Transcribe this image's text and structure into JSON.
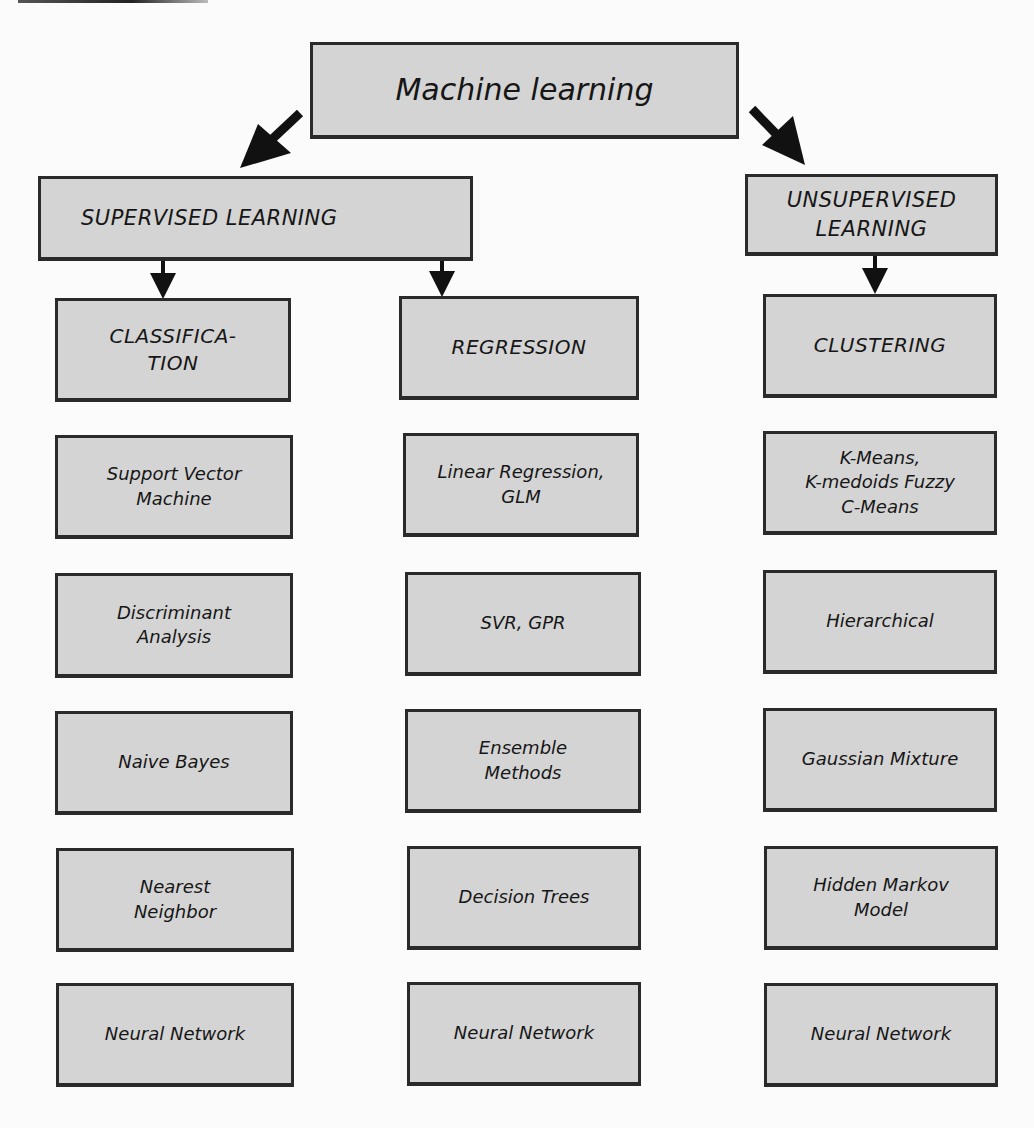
{
  "diagram": {
    "root": {
      "label": "Machine learning"
    },
    "branches": [
      {
        "label": "SUPERVISED LEARNING",
        "categories": [
          {
            "label": "CLASSIFICA-\nTION",
            "methods": [
              "Support Vector\nMachine",
              "Discriminant\nAnalysis",
              "Naive Bayes",
              "Nearest\nNeighbor",
              "Neural Network"
            ]
          },
          {
            "label": "REGRESSION",
            "methods": [
              "Linear Regression,\nGLM",
              "SVR, GPR",
              "Ensemble\nMethods",
              "Decision Trees",
              "Neural Network"
            ]
          }
        ]
      },
      {
        "label": "UNSUPERVISED\nLEARNING",
        "categories": [
          {
            "label": "CLUSTERING",
            "methods": [
              "K-Means,\nK-medoids Fuzzy\nC-Means",
              "Hierarchical",
              "Gaussian Mixture",
              "Hidden Markov\nModel",
              "Neural Network"
            ]
          }
        ]
      }
    ]
  },
  "colors": {
    "box_fill": "#d4d4d4",
    "box_border": "#2a2a2a",
    "arrow": "#111111",
    "background": "#fbfbfb"
  }
}
